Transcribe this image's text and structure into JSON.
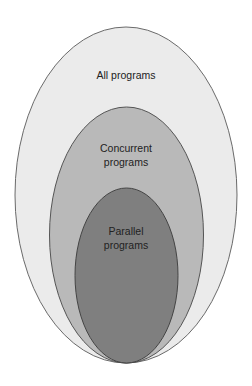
{
  "diagram": {
    "type": "nested-set (Venn/Euler) diagram",
    "sets": [
      {
        "id": "all",
        "label": "All programs",
        "label_lines": [
          "All programs"
        ],
        "fill": "#ebebeb",
        "stroke": "#6a6a6a",
        "contains": [
          "concurrent"
        ]
      },
      {
        "id": "concurrent",
        "label": "Concurrent programs",
        "label_lines": [
          "Concurrent",
          "programs"
        ],
        "fill": "#b9b9b9",
        "stroke": "#555555",
        "contains": [
          "parallel"
        ]
      },
      {
        "id": "parallel",
        "label": "Parallel programs",
        "label_lines": [
          "Parallel",
          "programs"
        ],
        "fill": "#7f7f7f",
        "stroke": "#444444",
        "contains": []
      }
    ]
  }
}
